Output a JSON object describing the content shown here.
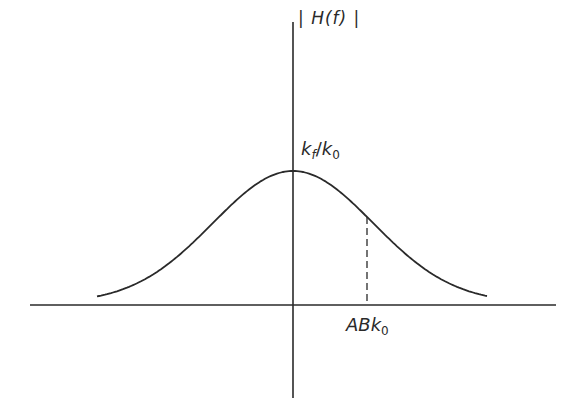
{
  "diagram": {
    "type": "gaussian-frequency-response",
    "y_axis_label": {
      "bar_left": "|",
      "text": "H(f)",
      "bar_right": "|"
    },
    "peak_label": {
      "main": "k",
      "sub": "f",
      "sep": "/",
      "main2": "k",
      "sub2": "0"
    },
    "x_mark_label": {
      "main": "ABk",
      "sub": "0"
    },
    "colors": {
      "stroke": "#2a2a2a",
      "background": "#ffffff"
    },
    "geometry": {
      "origin_x": 293,
      "baseline_y": 305,
      "peak_y": 171,
      "x_axis_range": [
        30,
        556
      ],
      "y_axis_range": [
        22,
        398
      ],
      "curve_range": [
        97,
        487
      ],
      "dashed_marker_x": 367
    }
  }
}
